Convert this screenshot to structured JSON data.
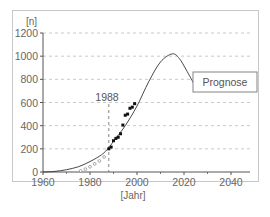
{
  "chart_data": {
    "type": "line",
    "title": "",
    "xlabel": "[Jahr]",
    "ylabel": "[n]",
    "xlim": [
      1960,
      2048
    ],
    "ylim": [
      0,
      1200
    ],
    "x_ticks": [
      1960,
      1980,
      2000,
      2020,
      2040
    ],
    "y_ticks": [
      0,
      200,
      400,
      600,
      800,
      1000,
      1200
    ],
    "grid": {
      "y": true,
      "x": false,
      "style": "dashed"
    },
    "annotations": [
      {
        "type": "vline",
        "x": 1988,
        "label": "1988",
        "style": "dashed"
      },
      {
        "type": "box",
        "label": "Prognose",
        "x": 2017,
        "y": 600
      }
    ],
    "series": [
      {
        "name": "Prognose-Kurve",
        "kind": "line",
        "x": [
          1960,
          1965,
          1970,
          1975,
          1980,
          1985,
          1988,
          1990,
          1995,
          2000,
          2005,
          2010,
          2015,
          2018,
          2021,
          2024
        ],
        "y": [
          0,
          5,
          20,
          45,
          90,
          150,
          210,
          265,
          400,
          570,
          780,
          950,
          1020,
          980,
          880,
          770
        ]
      },
      {
        "name": "Messwerte (gefüllt)",
        "kind": "scatter",
        "marker": "filled",
        "x": [
          1988,
          1989,
          1990,
          1991,
          1992,
          1993,
          1994,
          1995,
          1996,
          1997,
          1998,
          1999
        ],
        "y": [
          200,
          215,
          270,
          290,
          300,
          330,
          405,
          490,
          500,
          550,
          560,
          590
        ]
      },
      {
        "name": "Messwerte (offen)",
        "kind": "scatter",
        "marker": "open",
        "x": [
          1976,
          1978,
          1980,
          1982,
          1984,
          1986
        ],
        "y": [
          10,
          25,
          45,
          70,
          95,
          130
        ]
      }
    ],
    "legend": null
  },
  "labels": {
    "y_unit": "[n]",
    "x_unit": "[Jahr]",
    "vline_label": "1988",
    "box_label": "Prognose",
    "y_ticks": [
      "0",
      "200",
      "400",
      "600",
      "800",
      "1000",
      "1200"
    ],
    "x_ticks": [
      "1960",
      "1980",
      "2000",
      "2020",
      "2040"
    ]
  },
  "colors": {
    "axis": "#555555",
    "grid": "#bbbbbb",
    "curve": "#333333",
    "marker": "#111111",
    "frame": "#c8c8c8",
    "text": "#666666"
  }
}
